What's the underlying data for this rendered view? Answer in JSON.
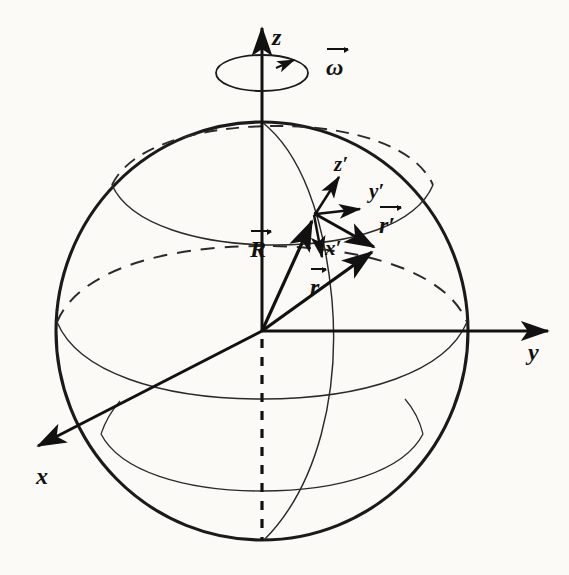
{
  "figure": {
    "background_color": "#fbfaf7",
    "ink_color": "#111111"
  },
  "axes": {
    "z": {
      "label": "z",
      "direction": "up",
      "description": "rotation axis"
    },
    "y": {
      "label": "y",
      "direction": "right"
    },
    "x": {
      "label": "x",
      "direction": "lower-left, out of page"
    }
  },
  "rotation": {
    "omega_label": "ω",
    "omega_is_vector": true,
    "sense": "counterclockwise about z"
  },
  "local_frame": {
    "z_prime": {
      "label": "z′",
      "direction": "radially outward / up-right"
    },
    "y_prime": {
      "label": "y′",
      "direction": "east / right"
    },
    "x_prime": {
      "label": "x′",
      "direction": "south / down"
    }
  },
  "vectors": [
    {
      "name": "R",
      "label": "R",
      "is_vector": true,
      "from": "origin",
      "to": "surface point P"
    },
    {
      "name": "r_prime",
      "label": "r′",
      "is_vector": true,
      "from": "surface point P",
      "to": "field point"
    },
    {
      "name": "r",
      "label": "r",
      "is_vector": true,
      "from": "origin",
      "to": "field point"
    }
  ],
  "sphere": {
    "outline": "great circle silhouette",
    "latitude_circles": 3,
    "meridian_curves": 1,
    "hidden_lines_style": "dashed"
  }
}
